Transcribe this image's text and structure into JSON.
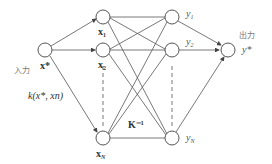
{
  "diagram": {
    "type": "gaussian-process-network",
    "input": {
      "caption": "入力",
      "label": "x*"
    },
    "kernel_label": "k(x*, xn)",
    "matrix_label": "K⁻¹",
    "training_nodes": [
      {
        "label": "x",
        "subscript": "1"
      },
      {
        "label": "x",
        "subscript": "2"
      },
      {
        "label": "x",
        "subscript": "N"
      }
    ],
    "target_nodes": [
      {
        "label": "y",
        "subscript": "1"
      },
      {
        "label": "y",
        "subscript": "2"
      },
      {
        "label": "y",
        "subscript": "N"
      }
    ],
    "output": {
      "caption": "出力",
      "label": "y*"
    },
    "colors": {
      "stroke": "#555555",
      "text": "#333333",
      "caption": "#777777"
    }
  }
}
